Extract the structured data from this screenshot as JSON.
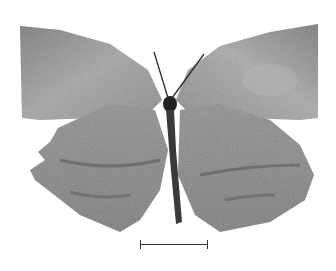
{
  "image": {
    "subject": "butterfly specimen, dorsal/ventral view, grayscale",
    "background_color": "#ffffff",
    "wing_color": "#8c8c8c",
    "wing_light_color": "#a8a8a8",
    "wing_dark_color": "#5a5a5a",
    "body_color": "#2a2a2a"
  },
  "scale_bar": {
    "label": ""
  }
}
